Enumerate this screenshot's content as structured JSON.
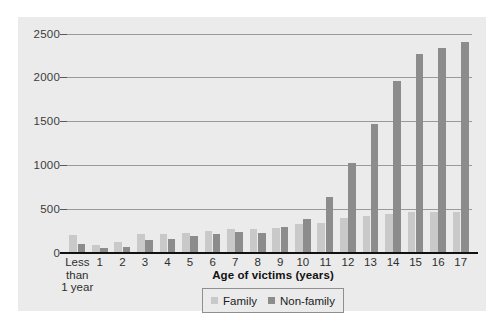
{
  "chart_data": {
    "type": "bar",
    "title": "",
    "xlabel": "Age of victims (years)",
    "ylabel": "",
    "ylim": [
      0,
      2500
    ],
    "yticks": [
      0,
      500,
      1000,
      1500,
      2000,
      2500
    ],
    "grid": true,
    "legend_position": "bottom",
    "categories": [
      "Less\nthan\n1 year",
      "1",
      "2",
      "3",
      "4",
      "5",
      "6",
      "7",
      "8",
      "9",
      "10",
      "11",
      "12",
      "13",
      "14",
      "15",
      "16",
      "17"
    ],
    "series": [
      {
        "name": "Family",
        "color": "#c9c9c9",
        "values": [
          200,
          90,
          130,
          215,
          215,
          230,
          250,
          275,
          275,
          290,
          330,
          345,
          395,
          425,
          440,
          470,
          470,
          470
        ]
      },
      {
        "name": "Non-family",
        "color": "#8c8c8c",
        "values": [
          100,
          55,
          70,
          145,
          165,
          190,
          215,
          235,
          230,
          295,
          390,
          640,
          1030,
          1470,
          1955,
          2270,
          2340,
          2400
        ]
      }
    ]
  },
  "legend": {
    "items": [
      {
        "label": "Family",
        "color": "#c9c9c9"
      },
      {
        "label": "Non-family",
        "color": "#8c8c8c"
      }
    ]
  },
  "axis": {
    "x_title": "Age of victims (years)"
  },
  "colors": {
    "panel_background": "#ebebeb",
    "gridline": "#9a9a9a",
    "axis_line": "#111111",
    "family_bar": "#c9c9c9",
    "nonfamily_bar": "#8c8c8c"
  }
}
